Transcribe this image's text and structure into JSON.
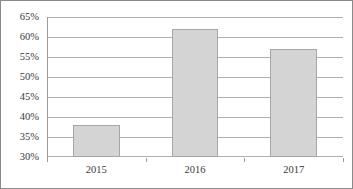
{
  "chart_data": {
    "type": "bar",
    "title": "",
    "subtitle": "",
    "xlabel": "",
    "ylabel": "",
    "categories": [
      "2015",
      "2016",
      "2017"
    ],
    "values": [
      38,
      62,
      57
    ],
    "value_suffix": "%",
    "ylim": [
      30,
      65
    ],
    "ytick_step": 5,
    "ytick_labels": [
      "30%",
      "35%",
      "40%",
      "45%",
      "50%",
      "55%",
      "60%",
      "65%"
    ],
    "ytick_values": [
      30,
      35,
      40,
      45,
      50,
      55,
      60,
      65
    ],
    "grid": true,
    "legend": false,
    "legend_position": "none",
    "series": [
      {
        "name": "",
        "values": [
          38,
          62,
          57
        ]
      }
    ]
  },
  "style": {
    "bar_fill": "#d4d4d4",
    "bar_border": "#a6a6a6",
    "gridline_color": "#b0b0b0",
    "axis_color": "#9a9a9a",
    "frame_color": "#8a8a8a",
    "text_color": "#3a3a3a",
    "background": "#ffffff"
  }
}
